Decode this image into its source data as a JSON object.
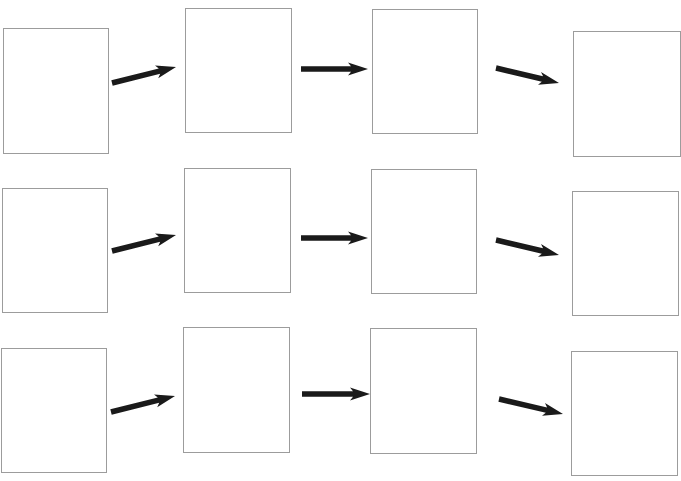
{
  "diagram": {
    "type": "flow-sequence-worksheet",
    "colors": {
      "background": "#ffffff",
      "box_border": "#9c9c9c",
      "arrow": "#1a1a1a"
    },
    "rows": [
      {
        "boxes": [
          {
            "x": 3,
            "y": 28,
            "w": 106,
            "h": 126,
            "text": ""
          },
          {
            "x": 185,
            "y": 8,
            "w": 107,
            "h": 125,
            "text": ""
          },
          {
            "x": 372,
            "y": 9,
            "w": 106,
            "h": 125,
            "text": ""
          },
          {
            "x": 573,
            "y": 31,
            "w": 108,
            "h": 126,
            "text": ""
          }
        ],
        "arrows": [
          {
            "x1": 112,
            "y1": 83,
            "x2": 176,
            "y2": 67
          },
          {
            "x1": 301,
            "y1": 69,
            "x2": 368,
            "y2": 69
          },
          {
            "x1": 496,
            "y1": 68,
            "x2": 559,
            "y2": 83
          }
        ]
      },
      {
        "boxes": [
          {
            "x": 2,
            "y": 188,
            "w": 106,
            "h": 125,
            "text": ""
          },
          {
            "x": 184,
            "y": 168,
            "w": 107,
            "h": 125,
            "text": ""
          },
          {
            "x": 371,
            "y": 169,
            "w": 106,
            "h": 125,
            "text": ""
          },
          {
            "x": 572,
            "y": 191,
            "w": 107,
            "h": 125,
            "text": ""
          }
        ],
        "arrows": [
          {
            "x1": 112,
            "y1": 251,
            "x2": 176,
            "y2": 235
          },
          {
            "x1": 301,
            "y1": 238,
            "x2": 368,
            "y2": 238
          },
          {
            "x1": 496,
            "y1": 240,
            "x2": 559,
            "y2": 255
          }
        ]
      },
      {
        "boxes": [
          {
            "x": 1,
            "y": 348,
            "w": 106,
            "h": 125,
            "text": ""
          },
          {
            "x": 183,
            "y": 327,
            "w": 107,
            "h": 126,
            "text": ""
          },
          {
            "x": 370,
            "y": 328,
            "w": 107,
            "h": 126,
            "text": ""
          },
          {
            "x": 571,
            "y": 351,
            "w": 107,
            "h": 125,
            "text": ""
          }
        ],
        "arrows": [
          {
            "x1": 111,
            "y1": 412,
            "x2": 175,
            "y2": 396
          },
          {
            "x1": 302,
            "y1": 394,
            "x2": 370,
            "y2": 394
          },
          {
            "x1": 499,
            "y1": 399,
            "x2": 563,
            "y2": 414
          }
        ]
      }
    ]
  }
}
